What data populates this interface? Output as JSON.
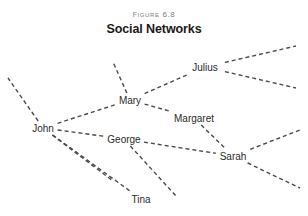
{
  "figure": {
    "number_label": "Figure 6.8",
    "title": "Social Networks"
  },
  "style": {
    "background": "#ffffff",
    "edge_color": "#4a4a4a",
    "label_color": "#2b2b2b",
    "fig_number_color": "#7c7c7c",
    "dash_pattern": "4 3"
  },
  "chart_data": {
    "type": "diagram",
    "diagram_kind": "node-link-network",
    "title": "Social Networks",
    "subtitle": "Figure 6.8",
    "nodes": [
      {
        "id": "john",
        "label": "John",
        "x": 43,
        "y": 128
      },
      {
        "id": "mary",
        "label": "Mary",
        "x": 130,
        "y": 100
      },
      {
        "id": "george",
        "label": "George",
        "x": 124,
        "y": 139
      },
      {
        "id": "julius",
        "label": "Julius",
        "x": 205,
        "y": 67
      },
      {
        "id": "margaret",
        "label": "Margaret",
        "x": 194,
        "y": 118
      },
      {
        "id": "sarah",
        "label": "Sarah",
        "x": 233,
        "y": 156
      },
      {
        "id": "tina",
        "label": "Tina",
        "x": 141,
        "y": 199
      }
    ],
    "edges": [
      {
        "from": "john",
        "to": "mary"
      },
      {
        "from": "john",
        "to": "george"
      },
      {
        "from": "john",
        "to": "tina"
      },
      {
        "from": "mary",
        "to": "julius"
      },
      {
        "from": "mary",
        "to": "margaret"
      },
      {
        "from": "george",
        "to": "sarah"
      },
      {
        "from": "margaret",
        "to": "sarah"
      }
    ],
    "dangling_edges": [
      {
        "from": "john",
        "to_x": 8,
        "to_y": 78
      },
      {
        "from": "john",
        "to_x": 113,
        "to_y": 181
      },
      {
        "from": "mary",
        "to_x": 113,
        "to_y": 62
      },
      {
        "from": "julius",
        "to_x": 296,
        "to_y": 46
      },
      {
        "from": "julius",
        "to_x": 296,
        "to_y": 88
      },
      {
        "from": "sarah",
        "to_x": 300,
        "to_y": 130
      },
      {
        "from": "sarah",
        "to_x": 300,
        "to_y": 188
      },
      {
        "from": "george",
        "to_x": 176,
        "to_y": 196
      }
    ]
  }
}
